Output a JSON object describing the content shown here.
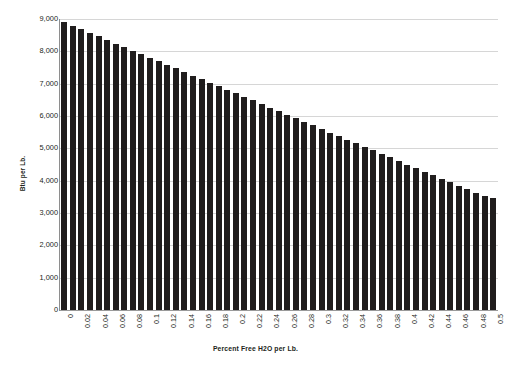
{
  "chart_data": {
    "type": "bar",
    "title": "",
    "xlabel": "Percent Free H2O per Lb.",
    "ylabel": "Btu per Lb.",
    "ylim": [
      0,
      9000
    ],
    "xlim": [
      0,
      0.5
    ],
    "grid": true,
    "legend": "none",
    "y_ticks": [
      9000,
      8000,
      7000,
      6000,
      5000,
      4000,
      3000,
      2000,
      1000,
      0
    ],
    "y_tick_labels": [
      "9,000",
      "8,000",
      "7,000",
      "6,000",
      "5,000",
      "4,000",
      "3,000",
      "2,000",
      "1,000",
      "0"
    ],
    "x_tick_labels": [
      "0",
      "0.02",
      "0.04",
      "0.06",
      "0.08",
      "0.1",
      "0.12",
      "0.14",
      "0.16",
      "0.18",
      "0.2",
      "0.22",
      "0.24",
      "0.26",
      "0.28",
      "0.3",
      "0.32",
      "0.34",
      "0.36",
      "0.38",
      "0.4",
      "0.42",
      "0.44",
      "0.46",
      "0.48",
      "0.5"
    ],
    "categories": [
      "0",
      "0.01",
      "0.02",
      "0.03",
      "0.04",
      "0.05",
      "0.06",
      "0.07",
      "0.08",
      "0.09",
      "0.1",
      "0.11",
      "0.12",
      "0.13",
      "0.14",
      "0.15",
      "0.16",
      "0.17",
      "0.18",
      "0.19",
      "0.2",
      "0.21",
      "0.22",
      "0.23",
      "0.24",
      "0.25",
      "0.26",
      "0.27",
      "0.28",
      "0.29",
      "0.3",
      "0.31",
      "0.32",
      "0.33",
      "0.34",
      "0.35",
      "0.36",
      "0.37",
      "0.38",
      "0.39",
      "0.4",
      "0.41",
      "0.42",
      "0.43",
      "0.44",
      "0.45",
      "0.46",
      "0.47",
      "0.48",
      "0.49",
      "0.5"
    ],
    "values": [
      8900,
      8790,
      8680,
      8570,
      8460,
      8350,
      8240,
      8130,
      8020,
      7910,
      7800,
      7690,
      7580,
      7470,
      7360,
      7250,
      7140,
      7030,
      6920,
      6810,
      6700,
      6590,
      6480,
      6370,
      6260,
      6150,
      6040,
      5930,
      5820,
      5710,
      5600,
      5490,
      5380,
      5270,
      5160,
      5050,
      4940,
      4830,
      4720,
      4610,
      4500,
      4390,
      4280,
      4170,
      4060,
      3950,
      3840,
      3730,
      3620,
      3540,
      3470
    ],
    "bar_color": "#201d1d",
    "gridline_color": "#d6d6d6",
    "background_color": "#ffffff"
  }
}
